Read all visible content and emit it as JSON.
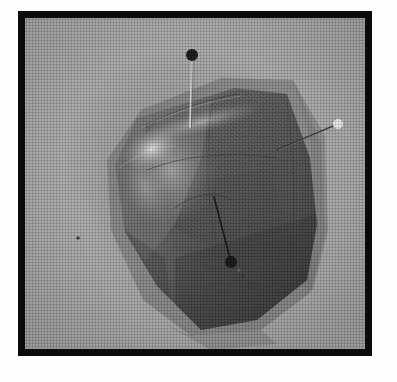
{
  "figure": {
    "kind": "grayscale-halftone-photograph",
    "caption_visible": false,
    "frame": {
      "border_color": "#0b0b0b",
      "border_width_px": 7,
      "x": 18,
      "y": 11,
      "width": 354,
      "height": 345
    },
    "background": {
      "page_color": "#fefefe",
      "field_color": "#a6a6a6",
      "field_shadow_color": "#8a8a8a",
      "texture": "halftone-dot-screen"
    }
  },
  "subject": {
    "name": "mesh-textured-specimen",
    "description": "dark irregular polygonal specimen with fine honeycomb mesh surface",
    "fill_dark": "#3a3a3a",
    "fill_mid": "#585858",
    "fill_light": "#7d7d7d",
    "highlight_color": "#d8d8d8",
    "mesh_texture": "hexagonal-dot-array"
  },
  "annotations": {
    "pins": [
      {
        "id": "pin-top",
        "label": "top-pin",
        "head_color": "#101010",
        "head_style": "filled-dark",
        "head_x": 192,
        "head_y": 55,
        "head_r": 6,
        "tip_x": 190,
        "tip_y": 127,
        "shaft_color": "#cfcfcf"
      },
      {
        "id": "pin-right",
        "label": "right-pin",
        "head_color": "#f2f2f2",
        "head_style": "filled-light",
        "head_x": 338,
        "head_y": 124,
        "head_r": 5,
        "tip_x": 277,
        "tip_y": 150,
        "shaft_color": "#2b2b2b"
      },
      {
        "id": "pin-lower",
        "label": "lower-pin",
        "head_color": "#0d0d0d",
        "head_style": "filled-dark",
        "head_x": 231,
        "head_y": 262,
        "head_r": 6,
        "tip_x": 214,
        "tip_y": 197,
        "shaft_color": "#111111"
      }
    ],
    "specks": [
      {
        "id": "speck-left",
        "x": 78,
        "y": 238
      },
      {
        "id": "speck-lower",
        "x": 243,
        "y": 276
      }
    ]
  }
}
